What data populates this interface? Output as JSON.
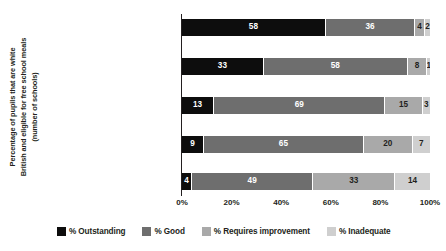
{
  "chart_data": {
    "type": "bar",
    "orientation": "horizontal",
    "stacked": true,
    "stack_mode": "percent",
    "title": "",
    "xlabel": "",
    "ylabel": "Percentage of pupils that are white British and eligible for free school meals (number of schools)",
    "ylabel_lines": [
      "Percentage of pupils that are white",
      "British and eligible for free school meals",
      "(number of schools)"
    ],
    "categories": [
      "0% - 7% (627 schools)",
      "7% - 13% (636 schools)",
      "13% - 19% (632 schools)",
      "19% - 29% (629 schools)",
      "29% - 72% (634 schools)"
    ],
    "series": [
      {
        "name": "% Outstanding",
        "color": "#0d0d0d",
        "values": [
          58,
          33,
          13,
          9,
          4
        ]
      },
      {
        "name": "% Good",
        "color": "#6e6e6e",
        "values": [
          36,
          58,
          69,
          65,
          49
        ]
      },
      {
        "name": "% Requires improvement",
        "color": "#a9a9a9",
        "values": [
          4,
          8,
          15,
          20,
          33
        ]
      },
      {
        "name": "% Inadequate",
        "color": "#cfcfcf",
        "values": [
          2,
          1,
          3,
          7,
          14
        ]
      }
    ],
    "xlim": [
      0,
      100
    ],
    "xticks": [
      0,
      20,
      40,
      60,
      80,
      100
    ],
    "xtick_labels": [
      "0%",
      "20%",
      "40%",
      "60%",
      "80%",
      "100%"
    ],
    "grid": false,
    "legend_position": "bottom"
  }
}
